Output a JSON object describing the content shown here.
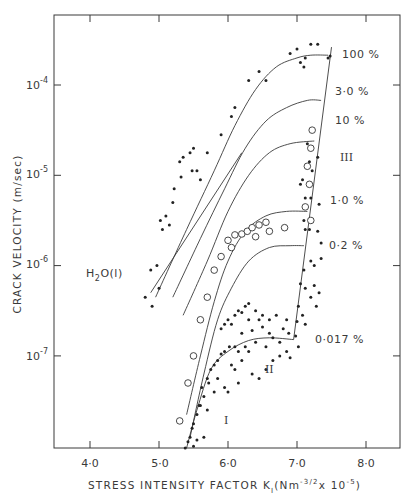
{
  "chart_data": {
    "type": "scatter",
    "title": "",
    "xlabel": "STRESS INTENSITY FACTOR K_I (Nm^-3/2 x 10^-5)",
    "ylabel": "CRACK VELOCITY (m/sec)",
    "xlim": [
      3.55,
      8.5
    ],
    "ylim_log10": [
      -8.0,
      -3.2
    ],
    "yscale": "log",
    "grid": false,
    "x_ticks": [
      "4·0",
      "5·0",
      "6·0",
      "7·0",
      "8·0"
    ],
    "y_ticks": [
      "10^-4",
      "10^-5",
      "10^-6",
      "10^-7"
    ],
    "y_tick_values": [
      -4,
      -5,
      -6,
      -7
    ],
    "x_tick_values": [
      4.0,
      5.0,
      6.0,
      7.0,
      8.0
    ],
    "regions": [
      {
        "label": "I",
        "x": 6.15,
        "logv": -7.9
      },
      {
        "label": "II",
        "x": 6.55,
        "logv": -7.35
      },
      {
        "label": "III",
        "x": 7.55,
        "logv": -5.2
      }
    ],
    "series": [
      {
        "name": "H2O(l)",
        "label": "H₂O(l)",
        "kind": "line",
        "points": [
          [
            4.88,
            -6.3
          ],
          [
            6.2,
            -4.75
          ]
        ]
      },
      {
        "name": "100 %",
        "label": "100 %",
        "kind": "curve",
        "points": [
          [
            4.95,
            -6.35
          ],
          [
            5.4,
            -5.6
          ],
          [
            5.8,
            -4.95
          ],
          [
            6.1,
            -4.45
          ],
          [
            6.4,
            -4.05
          ],
          [
            6.7,
            -3.8
          ],
          [
            7.0,
            -3.7
          ],
          [
            7.2,
            -3.67
          ],
          [
            7.45,
            -3.67
          ]
        ]
      },
      {
        "name": "30 %",
        "label": "3·0 %",
        "kind": "curve",
        "points": [
          [
            5.2,
            -6.35
          ],
          [
            5.6,
            -5.7
          ],
          [
            5.95,
            -5.15
          ],
          [
            6.25,
            -4.7
          ],
          [
            6.55,
            -4.4
          ],
          [
            6.85,
            -4.25
          ],
          [
            7.15,
            -4.17
          ],
          [
            7.35,
            -4.17
          ]
        ]
      },
      {
        "name": "10 %",
        "label": "10 %",
        "kind": "curve",
        "points": [
          [
            5.35,
            -6.55
          ],
          [
            5.7,
            -5.95
          ],
          [
            6.0,
            -5.4
          ],
          [
            6.3,
            -5.0
          ],
          [
            6.6,
            -4.75
          ],
          [
            6.9,
            -4.65
          ],
          [
            7.25,
            -4.62
          ]
        ]
      },
      {
        "name": "1.0 %",
        "label": "1·0 %",
        "kind": "curve",
        "points": [
          [
            5.4,
            -7.65
          ],
          [
            5.6,
            -7.0
          ],
          [
            5.8,
            -6.4
          ],
          [
            6.0,
            -5.95
          ],
          [
            6.25,
            -5.62
          ],
          [
            6.55,
            -5.45
          ],
          [
            6.85,
            -5.4
          ],
          [
            7.15,
            -5.4
          ]
        ]
      },
      {
        "name": "0.2 %",
        "label": "0·2 %",
        "kind": "curve",
        "points": [
          [
            5.45,
            -7.9
          ],
          [
            5.65,
            -7.2
          ],
          [
            5.85,
            -6.6
          ],
          [
            6.05,
            -6.25
          ],
          [
            6.3,
            -5.95
          ],
          [
            6.6,
            -5.8
          ],
          [
            6.9,
            -5.78
          ],
          [
            7.1,
            -5.78
          ]
        ]
      },
      {
        "name": "0.017 %",
        "label": "0·017 %",
        "kind": "curve",
        "points": [
          [
            5.4,
            -8.02
          ],
          [
            5.55,
            -7.6
          ],
          [
            5.75,
            -7.15
          ],
          [
            6.0,
            -6.95
          ],
          [
            6.3,
            -6.83
          ],
          [
            6.6,
            -6.8
          ],
          [
            6.95,
            -6.82
          ]
        ]
      },
      {
        "name": "region III boundary",
        "kind": "line",
        "points": [
          [
            6.95,
            -6.82
          ],
          [
            7.5,
            -3.58
          ]
        ]
      },
      {
        "name": "solid points",
        "kind": "scatter",
        "marker": "filled-circle",
        "points": [
          [
            4.8,
            -6.35
          ],
          [
            4.9,
            -6.45
          ],
          [
            4.88,
            -6.05
          ],
          [
            5.0,
            -6.25
          ],
          [
            4.97,
            -6.0
          ],
          [
            5.05,
            -5.6
          ],
          [
            5.1,
            -5.45
          ],
          [
            5.02,
            -5.5
          ],
          [
            5.15,
            -5.55
          ],
          [
            5.2,
            -5.3
          ],
          [
            5.22,
            -5.15
          ],
          [
            5.3,
            -4.85
          ],
          [
            5.35,
            -4.8
          ],
          [
            5.32,
            -5.02
          ],
          [
            5.45,
            -4.75
          ],
          [
            5.5,
            -4.7
          ],
          [
            5.48,
            -4.95
          ],
          [
            5.55,
            -4.95
          ],
          [
            5.6,
            -5.05
          ],
          [
            5.7,
            -4.75
          ],
          [
            5.9,
            -4.55
          ],
          [
            6.05,
            -4.35
          ],
          [
            6.1,
            -4.25
          ],
          [
            6.3,
            -3.95
          ],
          [
            6.45,
            -3.85
          ],
          [
            6.55,
            -3.95
          ],
          [
            6.9,
            -3.65
          ],
          [
            7.0,
            -3.6
          ],
          [
            7.05,
            -3.75
          ],
          [
            7.1,
            -3.8
          ],
          [
            7.12,
            -3.7
          ],
          [
            7.2,
            -3.55
          ],
          [
            7.3,
            -3.55
          ],
          [
            7.45,
            -3.7
          ],
          [
            7.48,
            -3.68
          ],
          [
            7.15,
            -4.65
          ],
          [
            7.18,
            -4.85
          ],
          [
            7.22,
            -4.95
          ],
          [
            7.3,
            -4.8
          ],
          [
            7.05,
            -5.1
          ],
          [
            7.08,
            -5.05
          ],
          [
            7.12,
            -5.25
          ],
          [
            7.2,
            -5.25
          ],
          [
            7.32,
            -5.32
          ],
          [
            7.1,
            -5.5
          ],
          [
            7.12,
            -5.6
          ],
          [
            7.18,
            -5.6
          ],
          [
            7.3,
            -5.62
          ],
          [
            7.35,
            -5.75
          ],
          [
            7.2,
            -5.95
          ],
          [
            7.25,
            -6.0
          ],
          [
            7.35,
            -5.92
          ],
          [
            7.1,
            -6.05
          ],
          [
            7.05,
            -6.2
          ],
          [
            7.12,
            -6.25
          ],
          [
            7.2,
            -6.35
          ],
          [
            7.02,
            -6.45
          ],
          [
            7.28,
            -6.45
          ],
          [
            7.25,
            -6.22
          ],
          [
            7.32,
            -6.3
          ],
          [
            7.08,
            -6.55
          ],
          [
            7.0,
            -6.62
          ],
          [
            7.12,
            -6.65
          ],
          [
            6.98,
            -6.78
          ],
          [
            7.02,
            -6.9
          ],
          [
            6.85,
            -6.6
          ],
          [
            6.8,
            -6.7
          ],
          [
            6.75,
            -6.85
          ],
          [
            6.65,
            -6.8
          ],
          [
            6.6,
            -6.75
          ],
          [
            6.55,
            -6.9
          ],
          [
            6.5,
            -6.68
          ],
          [
            6.45,
            -6.6
          ],
          [
            6.4,
            -6.85
          ],
          [
            6.35,
            -6.72
          ],
          [
            6.3,
            -6.95
          ],
          [
            6.25,
            -6.9
          ],
          [
            6.2,
            -6.75
          ],
          [
            6.15,
            -6.95
          ],
          [
            6.1,
            -6.9
          ],
          [
            6.05,
            -7.1
          ],
          [
            6.02,
            -6.9
          ],
          [
            5.95,
            -6.95
          ],
          [
            5.9,
            -6.98
          ],
          [
            5.85,
            -7.05
          ],
          [
            5.8,
            -7.1
          ],
          [
            5.75,
            -7.15
          ],
          [
            5.72,
            -7.3
          ],
          [
            5.7,
            -7.25
          ],
          [
            5.65,
            -7.45
          ],
          [
            5.62,
            -7.35
          ],
          [
            5.6,
            -7.55
          ],
          [
            5.58,
            -7.55
          ],
          [
            5.55,
            -7.65
          ],
          [
            5.5,
            -7.75
          ],
          [
            5.48,
            -7.8
          ],
          [
            5.45,
            -7.9
          ],
          [
            5.42,
            -7.95
          ],
          [
            5.38,
            -8.02
          ],
          [
            5.5,
            -8.0
          ],
          [
            5.55,
            -7.93
          ],
          [
            5.65,
            -7.9
          ],
          [
            5.7,
            -7.6
          ],
          [
            5.8,
            -7.4
          ],
          [
            5.85,
            -7.25
          ],
          [
            5.95,
            -7.35
          ],
          [
            6.0,
            -7.4
          ],
          [
            6.15,
            -7.3
          ],
          [
            6.1,
            -7.15
          ],
          [
            6.2,
            -7.05
          ],
          [
            6.35,
            -7.2
          ],
          [
            6.45,
            -7.25
          ],
          [
            6.55,
            -7.15
          ],
          [
            6.65,
            -7.05
          ],
          [
            6.75,
            -7.0
          ],
          [
            6.85,
            -6.95
          ],
          [
            6.9,
            -7.02
          ],
          [
            6.88,
            -6.75
          ],
          [
            6.7,
            -6.55
          ],
          [
            6.6,
            -6.6
          ],
          [
            6.5,
            -6.55
          ],
          [
            6.4,
            -6.5
          ],
          [
            6.3,
            -6.6
          ],
          [
            5.9,
            -6.7
          ],
          [
            5.95,
            -6.65
          ],
          [
            6.0,
            -6.6
          ],
          [
            6.05,
            -6.65
          ],
          [
            6.1,
            -6.55
          ],
          [
            6.15,
            -6.5
          ],
          [
            6.2,
            -6.52
          ],
          [
            6.25,
            -6.45
          ],
          [
            6.3,
            -6.42
          ]
        ]
      },
      {
        "name": "open points",
        "kind": "scatter",
        "marker": "open-circle",
        "points": [
          [
            5.3,
            -7.72
          ],
          [
            5.42,
            -7.3
          ],
          [
            5.5,
            -7.0
          ],
          [
            5.6,
            -6.6
          ],
          [
            5.7,
            -6.35
          ],
          [
            5.8,
            -6.05
          ],
          [
            5.9,
            -5.9
          ],
          [
            6.0,
            -5.72
          ],
          [
            6.05,
            -5.8
          ],
          [
            6.1,
            -5.66
          ],
          [
            6.2,
            -5.65
          ],
          [
            6.28,
            -5.62
          ],
          [
            6.35,
            -5.58
          ],
          [
            6.45,
            -5.55
          ],
          [
            6.55,
            -5.52
          ],
          [
            6.4,
            -5.68
          ],
          [
            6.6,
            -5.62
          ],
          [
            6.82,
            -5.58
          ],
          [
            7.12,
            -5.35
          ],
          [
            7.15,
            -4.9
          ],
          [
            7.2,
            -4.7
          ],
          [
            7.18,
            -5.1
          ],
          [
            7.2,
            -5.5
          ],
          [
            7.22,
            -4.5
          ]
        ]
      }
    ],
    "labels_right": [
      "100 %",
      "3·0 %",
      "10 %",
      "1·0 %",
      "0·2 %",
      "0·017 %"
    ]
  },
  "axes": {
    "x_title": "STRESS INTENSITY FACTOR K",
    "x_title_sub": "I",
    "x_title_units_open": "(Nm",
    "x_title_units_exp": "-3/2",
    "x_title_units_mid": "x 10",
    "x_title_units_exp2": "-5",
    "x_title_units_close": ")",
    "y_title": "CRACK VELOCITY (m/sec)",
    "y_tick_base": "10",
    "y_tick_exps": [
      "-4",
      "-5",
      "-6",
      "-7"
    ],
    "x_tick_labels": [
      "4·0",
      "5·0",
      "6·0",
      "7·0",
      "8·0"
    ]
  },
  "annotations": {
    "h2o_label": "H",
    "h2o_sub": "2",
    "h2o_rest": "O(l)",
    "region_I": "I",
    "region_II": "II",
    "region_III": "III",
    "pct_100": "100 %",
    "pct_30": "3·0 %",
    "pct_10": "10 %",
    "pct_1": "1·0 %",
    "pct_02": "0·2 %",
    "pct_0017": "0·017 %"
  }
}
